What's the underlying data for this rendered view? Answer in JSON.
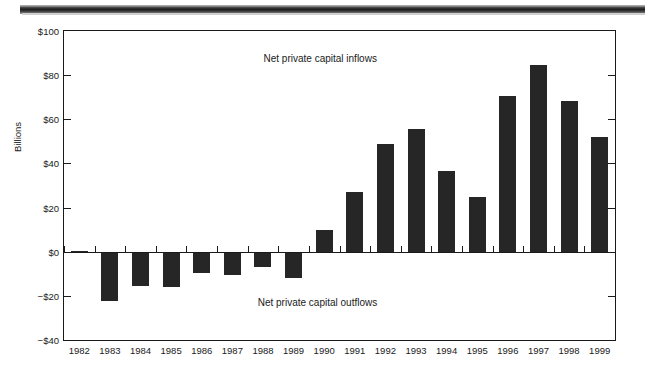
{
  "figure": {
    "axis_title": "Billions",
    "frame": {
      "x": 63,
      "y": 30,
      "width": 553,
      "height": 311
    }
  },
  "annotations": [
    {
      "text": "Net private capital inflows",
      "x_pct": 46.5,
      "y_px": 52
    },
    {
      "text": "Net private capital outflows",
      "x_pct": 46.0,
      "y_px": 296
    }
  ],
  "chart_data": {
    "type": "bar",
    "title": "",
    "xlabel": "",
    "ylabel": "Billions",
    "ylim": [
      -40,
      100
    ],
    "yticks": [
      -40,
      -20,
      0,
      20,
      40,
      60,
      80,
      100
    ],
    "ytick_labels": [
      "−$40",
      "−$20",
      "$0",
      "$20",
      "$40",
      "$60",
      "$80",
      "$100"
    ],
    "grid": false,
    "legend": null,
    "zero_line": true,
    "bar_color": "#262626",
    "categories": [
      "1982",
      "1983",
      "1984",
      "1985",
      "1986",
      "1987",
      "1988",
      "1989",
      "1990",
      "1991",
      "1992",
      "1993",
      "1994",
      "1995",
      "1996",
      "1997",
      "1998",
      "1999"
    ],
    "values": [
      0.3,
      -22.5,
      -15.5,
      -16.0,
      -9.5,
      -10.5,
      -7.0,
      -12.0,
      10.0,
      27.0,
      49.0,
      55.5,
      36.5,
      25.0,
      70.5,
      84.5,
      68.5,
      52.0
    ],
    "units": "Billions of dollars"
  }
}
